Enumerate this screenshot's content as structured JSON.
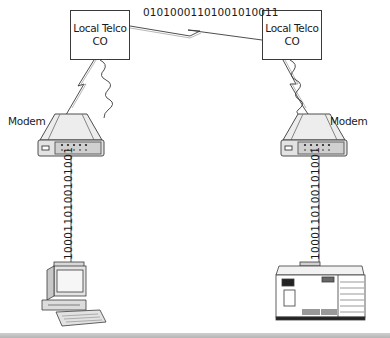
{
  "diagram": {
    "nodes": {
      "co_left": {
        "line1": "Local Telco",
        "line2": "CO"
      },
      "co_right": {
        "line1": "Local Telco",
        "line2": "CO"
      },
      "modem_left": {
        "label": "Modem"
      },
      "modem_right": {
        "label": "Modem"
      },
      "computer_left": {
        "label": ""
      },
      "server_right": {
        "label": ""
      }
    },
    "links": {
      "trunk": {
        "bits": "01010001101001010011",
        "type": "digital"
      },
      "left_local_loop": {
        "type": "analog"
      },
      "right_local_loop": {
        "type": "analog"
      },
      "left_serial": {
        "bits": "1000110100101001",
        "type": "digital"
      },
      "right_serial": {
        "bits": "1000110100101001",
        "type": "digital"
      }
    },
    "colors": {
      "line": "#3a3a3a",
      "modem_fill": "#e6e6e6",
      "modem_panel": "#cfcfcf",
      "rule": "#bdbdbd"
    }
  }
}
